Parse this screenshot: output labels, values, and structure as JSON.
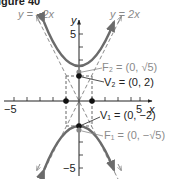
{
  "figure": {
    "title_fragment": "igure 40",
    "equation_type": "hyperbola",
    "axes": {
      "x_label": "x",
      "y_label": "y",
      "x_ticks": {
        "min_label": "−5",
        "max_label": "5"
      },
      "y_ticks": {
        "max_label": "5",
        "min_label": "−5"
      }
    },
    "asymptotes": [
      {
        "label": "y = −2x",
        "slope": -2
      },
      {
        "label": "y = 2x",
        "slope": 2
      }
    ],
    "points": [
      {
        "name": "F2",
        "label": "F₂ = (0, √5)",
        "x": 0,
        "y": 2.236
      },
      {
        "name": "V2",
        "label": "V₂ = (0, 2)",
        "x": 0,
        "y": 2
      },
      {
        "name": "V1",
        "label": "V₁ = (0, −2)",
        "x": 0,
        "y": -2
      },
      {
        "name": "F1",
        "label": "F₁ = (0, −√5)",
        "x": 0,
        "y": -2.236
      },
      {
        "name": "P_left",
        "label": "",
        "x": -1,
        "y": 0
      },
      {
        "name": "P_right",
        "label": "",
        "x": 1,
        "y": 0
      }
    ],
    "colors": {
      "curve": "#6b6b6b",
      "axis": "#222222",
      "asymptote": "#8a8a8a",
      "vertex_point": "#111111",
      "focus_point": "#888888"
    }
  }
}
